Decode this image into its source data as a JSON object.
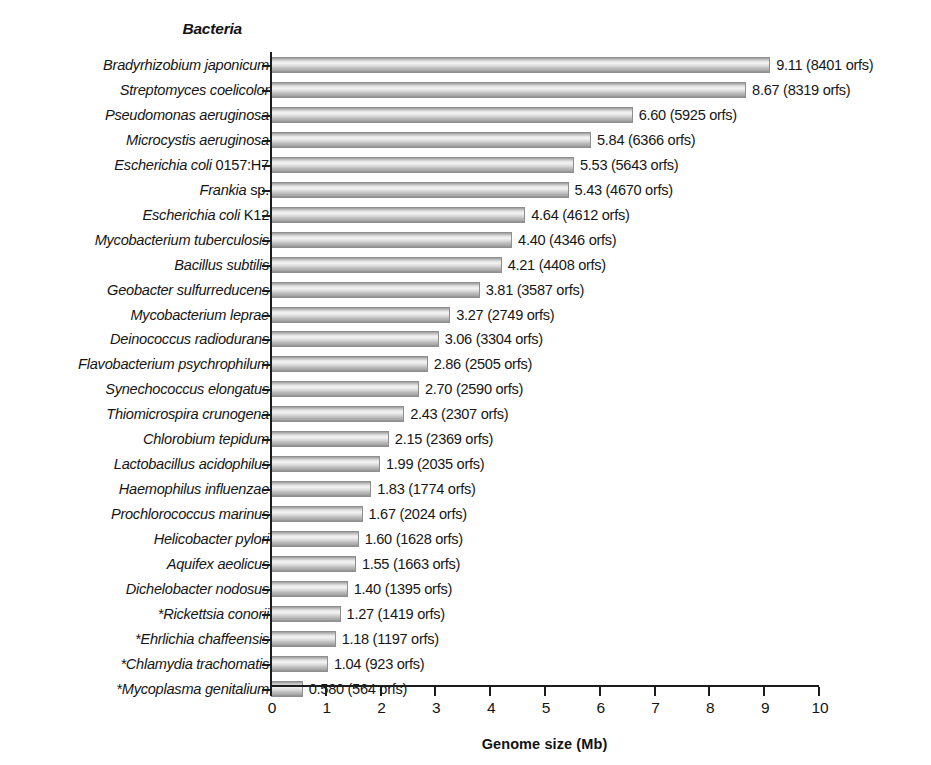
{
  "chart_data": {
    "type": "bar",
    "orientation": "horizontal",
    "title": "Bacteria",
    "xlabel": "Genome size (Mb)",
    "ylabel": "",
    "xlim": [
      0,
      10
    ],
    "xticks": [
      0,
      1,
      2,
      3,
      4,
      5,
      6,
      7,
      8,
      9,
      10
    ],
    "xtick_labels": [
      "0",
      "1",
      "2",
      "3",
      "4",
      "5",
      "6",
      "7",
      "8",
      "9",
      "10"
    ],
    "grid": false,
    "legend": null,
    "categories": [
      "Bradyrhizobium japonicum",
      "Streptomyces coelicolor",
      "Pseudomonas aeruginosa",
      "Microcystis aeruginosa",
      "Escherichia coli 0157:H7",
      "Frankia sp.",
      "Escherichia coli K12",
      "Mycobacterium tuberculosis",
      "Bacillus subtilis",
      "Geobacter sulfurreducens",
      "Mycobacterium leprae",
      "Deinococcus radiodurans",
      "Flavobacterium psychrophilum",
      "Synechococcus elongatus",
      "Thiomicrospira crunogena",
      "Chlorobium tepidum",
      "Lactobacillus acidophilus",
      "Haemophilus influenzae",
      "Prochlorococcus marinus",
      "Helicobacter pylori",
      "Aquifex aeolicus",
      "Dichelobacter nodosus",
      "*Rickettsia conorii",
      "*Ehrlichia chaffeensis",
      "*Chlamydia trachomatis",
      "*Mycoplasma genitalium"
    ],
    "values": [
      9.11,
      8.67,
      6.6,
      5.84,
      5.53,
      5.43,
      4.64,
      4.4,
      4.21,
      3.81,
      3.27,
      3.06,
      2.86,
      2.7,
      2.43,
      2.15,
      1.99,
      1.83,
      1.67,
      1.6,
      1.55,
      1.4,
      1.27,
      1.18,
      1.04,
      0.58
    ],
    "orfs": [
      8401,
      8319,
      5925,
      6366,
      5643,
      4670,
      4612,
      4346,
      4408,
      3587,
      2749,
      3304,
      2505,
      2590,
      2307,
      2369,
      2035,
      1774,
      2024,
      1628,
      1663,
      1395,
      1419,
      1197,
      923,
      564
    ],
    "data_labels": [
      "9.11 (8401 orfs)",
      "8.67 (8319 orfs)",
      "6.60 (5925 orfs)",
      "5.84 (6366 orfs)",
      "5.53 (5643 orfs)",
      "5.43 (4670 orfs)",
      "4.64 (4612 orfs)",
      "4.40 (4346 orfs)",
      "4.21 (4408 orfs)",
      "3.81 (3587 orfs)",
      "3.27 (2749 orfs)",
      "3.06 (3304 orfs)",
      "2.86 (2505 orfs)",
      "2.70 (2590 orfs)",
      "2.43 (2307 orfs)",
      "2.15 (2369 orfs)",
      "1.99 (2035 orfs)",
      "1.83 (1774 orfs)",
      "1.67 (2024 orfs)",
      "1.60 (1628 orfs)",
      "1.55 (1663 orfs)",
      "1.40 (1395 orfs)",
      "1.27 (1419 orfs)",
      "1.18 (1197 orfs)",
      "1.04 (923 orfs)",
      "0.580 (564 orfs)"
    ],
    "label_nonitalic_suffix": {
      "Escherichia coli 0157:H7": "0157:H7",
      "Escherichia coli K12": "K12",
      "Frankia sp.": "sp."
    },
    "colors": {
      "bar_light": "#f3f3f3",
      "bar_mid": "#c9c9c9",
      "bar_dark": "#8e8e8e",
      "bar_border": "#8f8f8f",
      "axis": "#1c1c1c",
      "text": "#141414",
      "background": "#ffffff"
    }
  }
}
